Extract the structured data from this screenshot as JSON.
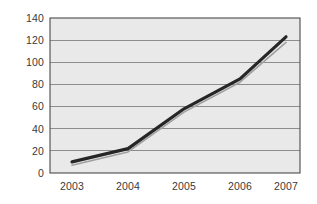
{
  "chart_data": {
    "type": "line",
    "title": "",
    "subtitle": "",
    "xlabel": "",
    "ylabel": "",
    "categories": [
      "2003",
      "2004",
      "2005",
      "2006",
      "2007"
    ],
    "x": [
      2003,
      2004,
      2005,
      2006,
      2007
    ],
    "xlim": [
      2003,
      2007
    ],
    "ylim": [
      0,
      140
    ],
    "y_ticks": [
      0,
      20,
      40,
      60,
      80,
      100,
      120,
      140
    ],
    "x_ticks": [
      "2003",
      "2004",
      "2005",
      "2006",
      "2007"
    ],
    "grid": "horizontal",
    "legend": "none",
    "series": [
      {
        "name": "series-1",
        "style": "thick-dark-line",
        "color": "#262626",
        "values": [
          10,
          22,
          58,
          85,
          123
        ]
      },
      {
        "name": "series-2",
        "style": "thin-gray-line",
        "color": "#a0a0a0",
        "values": [
          7,
          19,
          55,
          82,
          118
        ]
      }
    ],
    "annotations": [],
    "colors": {
      "plot_background": "#e9e9e9",
      "page_background": "#ffffff",
      "gridline": "#8d8d8d",
      "axis": "#4a4a4a",
      "tick_label": "#3a3a3a"
    }
  },
  "axis_labels": {
    "y": {
      "t0": "0",
      "t1": "20",
      "t2": "40",
      "t3": "60",
      "t4": "80",
      "t5": "100",
      "t6": "120",
      "t7": "140"
    },
    "x": {
      "t0": "2003",
      "t1": "2004",
      "t2": "2005",
      "t3": "2006",
      "t4": "2007"
    }
  }
}
